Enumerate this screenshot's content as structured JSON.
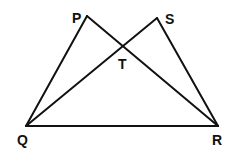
{
  "diagram": {
    "type": "geometry",
    "points": {
      "P": {
        "label": "P",
        "x": 87,
        "y": 16
      },
      "S": {
        "label": "S",
        "x": 157,
        "y": 18
      },
      "T": {
        "label": "T",
        "x": 124,
        "y": 48
      },
      "Q": {
        "label": "Q",
        "x": 26,
        "y": 126
      },
      "R": {
        "label": "R",
        "x": 218,
        "y": 126
      }
    },
    "segments": [
      "PQ",
      "PR",
      "SQ",
      "SR",
      "QR"
    ],
    "intersection": {
      "point": "T",
      "of": [
        "PR",
        "SQ"
      ]
    }
  }
}
